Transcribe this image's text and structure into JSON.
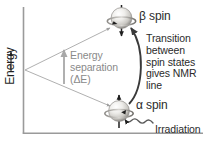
{
  "figure": {
    "axes": {
      "y_label": "Energy",
      "y_arrow": "up-arrow",
      "x_label": ""
    },
    "labels": {
      "beta_spin": "β spin",
      "alpha_spin": "α spin",
      "transition": "Transition between spin states gives NMR line",
      "irradiation": "Irradiation",
      "energy_separation_line1": "Energy",
      "energy_separation_line2": "separation",
      "energy_separation_line3": "(ΔE)"
    },
    "colors": {
      "axis": "#9a9a9a",
      "text_dark": "#2b2b2b",
      "text_grey": "#8a8a8a",
      "guide_line": "#a8a8a8",
      "transition_arrow": "#3a3a3a",
      "sphere_light": "#f2f1ef",
      "sphere_shadow": "#9e9c98",
      "ring": "#6f6d69"
    },
    "elements": {
      "upper_level_name": "beta-spin-state",
      "lower_level_name": "alpha-spin-state",
      "transition_arrow_name": "transition-arrow",
      "irradiation_arrow_name": "irradiation-squiggle-arrow",
      "energy_gap_arrow_name": "energy-separation-arrow",
      "splitting_guides_name": "energy-splitting-guides"
    }
  }
}
